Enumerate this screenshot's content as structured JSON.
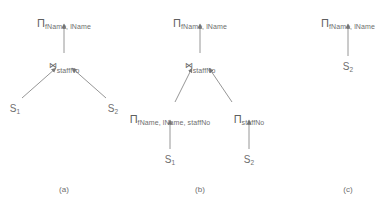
{
  "figure": {
    "background_color": "#ffffff",
    "ink_color": "#6e6e6e",
    "width": 384,
    "height": 206
  },
  "symbols": {
    "projection": "Π",
    "join": "⋈",
    "relation": "S"
  },
  "diagrams": [
    {
      "id": "a",
      "caption": "(a)",
      "caption_x": 64,
      "caption_y": 186,
      "nodes": [
        {
          "name": "projection-root",
          "op": "Π",
          "subscript": "fName, lName",
          "x": 64,
          "y": 14,
          "kind": "projection"
        },
        {
          "name": "join",
          "op": "⋈",
          "subscript": "staffNo",
          "x": 64,
          "y": 58,
          "kind": "join"
        },
        {
          "name": "relation-s1",
          "op": "S",
          "subscript": "1",
          "x": 15,
          "y": 104,
          "kind": "relation"
        },
        {
          "name": "relation-s2",
          "op": "S",
          "subscript": "2",
          "x": 113,
          "y": 104,
          "kind": "relation"
        }
      ],
      "edges": [
        {
          "name": "edge-join-to-projection",
          "x1": 64,
          "y1": 53,
          "x2": 64,
          "y2": 24
        },
        {
          "name": "edge-s1-to-join",
          "x1": 22,
          "y1": 98,
          "x2": 56,
          "y2": 68
        },
        {
          "name": "edge-s2-to-join",
          "x1": 106,
          "y1": 98,
          "x2": 72,
          "y2": 68
        }
      ]
    },
    {
      "id": "b",
      "caption": "(b)",
      "caption_x": 200,
      "caption_y": 186,
      "nodes": [
        {
          "name": "projection-root",
          "op": "Π",
          "subscript": "fName, lName",
          "x": 200,
          "y": 14,
          "kind": "projection"
        },
        {
          "name": "join",
          "op": "⋈",
          "subscript": "staffNo",
          "x": 200,
          "y": 58,
          "kind": "join"
        },
        {
          "name": "projection-left",
          "op": "Π",
          "subscript": "fName, lName, staffNo",
          "x": 170,
          "y": 110,
          "kind": "projection"
        },
        {
          "name": "projection-right",
          "op": "Π",
          "subscript": "staffNo",
          "x": 249,
          "y": 110,
          "kind": "projection"
        },
        {
          "name": "relation-s1",
          "op": "S",
          "subscript": "1",
          "x": 170,
          "y": 155,
          "kind": "relation"
        },
        {
          "name": "relation-s2",
          "op": "S",
          "subscript": "2",
          "x": 249,
          "y": 155,
          "kind": "relation"
        }
      ],
      "edges": [
        {
          "name": "edge-join-to-projection",
          "x1": 200,
          "y1": 53,
          "x2": 200,
          "y2": 24
        },
        {
          "name": "edge-projleft-to-join",
          "x1": 175,
          "y1": 102,
          "x2": 192,
          "y2": 68
        },
        {
          "name": "edge-projright-to-join",
          "x1": 232,
          "y1": 102,
          "x2": 209,
          "y2": 68
        },
        {
          "name": "edge-s1-to-projleft",
          "x1": 170,
          "y1": 149,
          "x2": 170,
          "y2": 120
        },
        {
          "name": "edge-s2-to-projright",
          "x1": 249,
          "y1": 149,
          "x2": 249,
          "y2": 120
        }
      ]
    },
    {
      "id": "c",
      "caption": "(c)",
      "caption_x": 348,
      "caption_y": 186,
      "nodes": [
        {
          "name": "projection-root",
          "op": "Π",
          "subscript": "fName, lName",
          "x": 348,
          "y": 14,
          "kind": "projection"
        },
        {
          "name": "relation-s2",
          "op": "S",
          "subscript": "2",
          "x": 348,
          "y": 62,
          "kind": "relation"
        }
      ],
      "edges": [
        {
          "name": "edge-s2-to-projection",
          "x1": 348,
          "y1": 56,
          "x2": 348,
          "y2": 24
        }
      ]
    }
  ]
}
